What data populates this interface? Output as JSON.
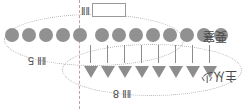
{
  "diagram": {
    "title_box": {
      "glyph_label": "‖‖",
      "box_value": ""
    },
    "divider": {
      "name": "split-line"
    },
    "groups": {
      "left": {
        "count": 5,
        "count_label": "‖‖ 5"
      },
      "right": {
        "count": 8,
        "count_label": "‖‖ 8"
      }
    },
    "rows": {
      "circles": {
        "total": 13,
        "left_count": 5,
        "right_count": 8,
        "color": "#919191"
      },
      "connectors": {
        "count": 8,
        "color": "#8d8d8d"
      },
      "triangles": {
        "count": 8,
        "color": "#8d8d8d"
      }
    },
    "side_labels": {
      "top_right": "要塞",
      "bottom_right": "主从少"
    },
    "colors": {
      "circle": "#919191",
      "triangle": "#8d8d8d",
      "connector": "#8d8d8d",
      "ellipse_dotted": "#b4b4b4",
      "divider_dashed": "#c0a0a0",
      "box_border": "#9a9a9a",
      "text": "#4a4a4a",
      "background": "#ffffff"
    }
  }
}
